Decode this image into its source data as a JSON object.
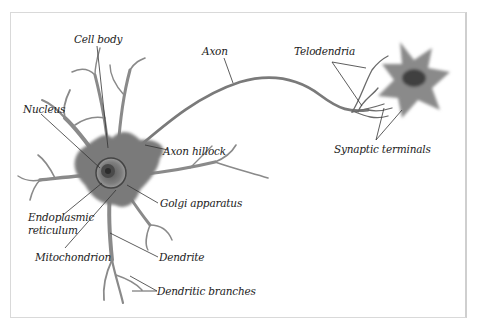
{
  "diagram": {
    "type": "labeled-illustration",
    "colors": {
      "cell_fill": "#7a7a7a",
      "cell_dark": "#4a4a4a",
      "leader_line": "#333333",
      "frame": "#d9d9d9"
    },
    "labels": [
      {
        "id": "cell-body",
        "text": "Cell body"
      },
      {
        "id": "axon",
        "text": "Axon"
      },
      {
        "id": "telodendria",
        "text": "Telodendria"
      },
      {
        "id": "nucleus",
        "text": "Nucleus"
      },
      {
        "id": "axon-hillock",
        "text": "Axon hillock"
      },
      {
        "id": "synaptic-terminals",
        "text": "Synaptic terminals"
      },
      {
        "id": "golgi-apparatus",
        "text": "Golgi apparatus"
      },
      {
        "id": "endoplasmic-reticulum-1",
        "text": "Endoplasmic"
      },
      {
        "id": "endoplasmic-reticulum-2",
        "text": "reticulum"
      },
      {
        "id": "mitochondrion",
        "text": "Mitochondrion"
      },
      {
        "id": "dendrite",
        "text": "Dendrite"
      },
      {
        "id": "dendritic-branches",
        "text": "Dendritic branches"
      }
    ]
  }
}
